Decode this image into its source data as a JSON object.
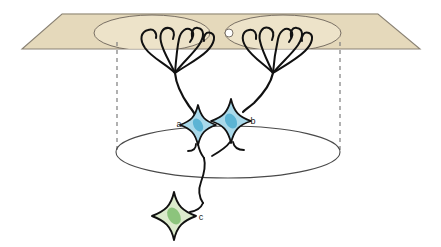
{
  "figure": {
    "background_color": "#ffffff"
  },
  "plane": {
    "name": "cortical-surface-plane",
    "fill_color": "#e5d9bb",
    "stroke_color": "#8a8274",
    "top_left_x": 62,
    "top_right_x": 378,
    "bottom_left_x": 22,
    "bottom_right_x": 420,
    "top_y": 14,
    "bottom_y": 49
  },
  "receptive_fields": [
    {
      "name": "receptive-field-left",
      "cx": 152,
      "cy": 33,
      "rx": 58,
      "ry": 18,
      "stroke_color": "#6b6258",
      "fill_color": "#f0e7cf"
    },
    {
      "name": "receptive-field-right",
      "cx": 283,
      "cy": 33,
      "rx": 58,
      "ry": 18,
      "stroke_color": "#6b6258",
      "fill_color": "#f0e7cf"
    }
  ],
  "overlap_marker": {
    "name": "receptive-field-overlap-node",
    "cx": 229,
    "cy": 33,
    "r": 4,
    "fill_color": "#ffffff",
    "stroke_color": "#6b6258"
  },
  "lower_ellipse": {
    "name": "target-layer-ellipse",
    "cx": 228,
    "cy": 152,
    "rx": 112,
    "ry": 26,
    "stroke_color": "#4a4a4a",
    "fill_color": "none"
  },
  "projection_lines": [
    {
      "name": "projection-line-left",
      "x": 117,
      "y1": 50,
      "y2": 152,
      "stroke_color": "#7d7d7d",
      "dash": "4,4"
    },
    {
      "name": "projection-line-right",
      "x": 340,
      "y1": 50,
      "y2": 152,
      "stroke_color": "#7d7d7d",
      "dash": "4,4"
    }
  ],
  "cells": [
    {
      "id": "a",
      "name": "neuron-soma-a",
      "label": "a",
      "label_x": 179,
      "label_y": 127,
      "cx": 198,
      "cy": 125,
      "size": 20,
      "body_fill": "#a9d9ea",
      "body_stroke": "#111111",
      "nucleus_fill": "#5cb4d4",
      "nucleus_rx": 4.5,
      "nucleus_ry": 7,
      "nucleus_rotate": -28
    },
    {
      "id": "b",
      "name": "neuron-soma-b",
      "label": "b",
      "label_x": 253,
      "label_y": 124,
      "cx": 231,
      "cy": 121,
      "size": 23,
      "body_fill": "#a9d9ea",
      "body_stroke": "#111111",
      "nucleus_fill": "#5cb4d4",
      "nucleus_rx": 5.5,
      "nucleus_ry": 8,
      "nucleus_rotate": -28
    },
    {
      "id": "c",
      "name": "neuron-soma-c",
      "label": "c",
      "label_x": 200,
      "label_y": 219,
      "cx": 174,
      "cy": 216,
      "size": 24,
      "body_fill": "#dcebcc",
      "body_stroke": "#111111",
      "nucleus_fill": "#8cc47c",
      "nucleus_rx": 6,
      "nucleus_ry": 9,
      "nucleus_rotate": -30
    }
  ],
  "dendrite_trees": [
    {
      "name": "dendrite-tree-left",
      "trunk_top_x": 175,
      "trunk_top_y": 73,
      "branch_count": 5
    },
    {
      "name": "dendrite-tree-right",
      "trunk_top_x": 273,
      "trunk_top_y": 73,
      "branch_count": 5
    }
  ],
  "axons": [
    {
      "name": "axon-a",
      "from": "a",
      "to": "convergence"
    },
    {
      "name": "axon-b",
      "from": "b",
      "to": "convergence"
    },
    {
      "name": "axon-descending",
      "from": "convergence",
      "to": "c"
    }
  ],
  "colors": {
    "plane_fill": "#e5d9bb",
    "plane_stroke": "#8a8274",
    "cell_blue": "#a9d9ea",
    "nucleus_blue": "#5cb4d4",
    "cell_green": "#dcebcc",
    "nucleus_green": "#8cc47c",
    "ink": "#111111",
    "dash_gray": "#7d7d7d"
  },
  "labels": {
    "a": "a",
    "b": "b",
    "c": "c"
  }
}
